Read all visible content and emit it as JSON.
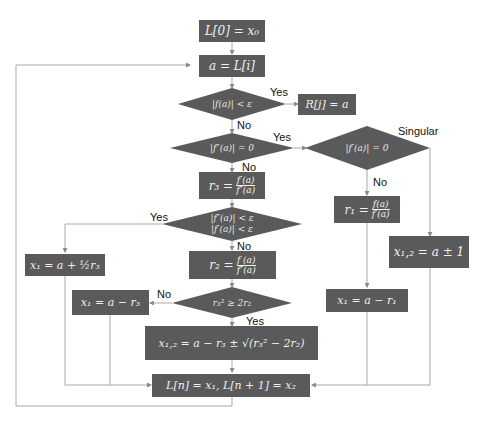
{
  "nodes": {
    "init": "L[0] = x₀",
    "assign": "a = L[i]",
    "root_found": "R[j] = a",
    "r3_lhs": "r₃ =",
    "r3_num": "f′(a)",
    "r3_den": "f″(a)",
    "r2_lhs": "r₂ =",
    "r2_num": "f (a)",
    "r2_den": "f″(a)",
    "r1_lhs": "r₁ =",
    "r1_num": "f(a)",
    "r1_den": "f′(a)",
    "x1_half": "x₁ = a + ½r₃",
    "x1_minus_r3": "x₁ = a − r₃",
    "x12_sqrt": "x₁,₂ = a − r₃ ± √(r₃² − 2r₂)",
    "x12_pm1": "x₁,₂ = a ± 1",
    "x1_minus_r1": "x₁ = a − r₁",
    "store": "L[n] = x₁, L[n + 1] = x₂"
  },
  "decisions": {
    "d1": "|f(a)| < ε",
    "d2": "|f″(a)| = 0",
    "d3": "|f′(a)| = 0",
    "d4_line1": "|f″(a)| < ε",
    "d4_line2": "|f′(a)| < ε",
    "d5": "r₃² ≥ 2r₂"
  },
  "labels": {
    "yes1": "Yes",
    "no1": "No",
    "yes2": "Yes",
    "no2": "No",
    "singular": "Singular",
    "no3": "No",
    "yes4": "Yes",
    "no4": "No",
    "no5": "No",
    "yes5": "Yes"
  },
  "colors": {
    "node_fill": "#5a5a5a",
    "edge": "#a8a8a8",
    "text_light": "#f0f0f0"
  }
}
